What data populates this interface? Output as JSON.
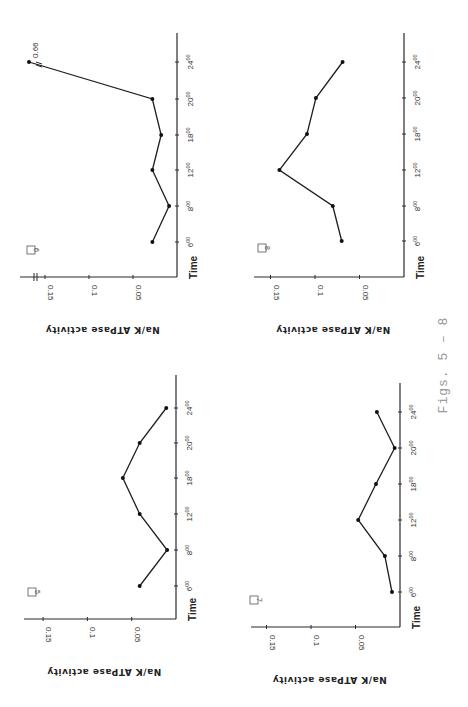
{
  "caption": "Figs. 5 – 8",
  "y_axis_title": "Na/K ATPase activity",
  "time_axis_title": "Time",
  "chart_data": [
    {
      "panel": "6",
      "type": "line",
      "title": "6",
      "xlabel": "Time",
      "ylabel": "Na/K ATPase activity",
      "categories": [
        "6:00",
        "8:00",
        "12:00",
        "18:00",
        "20:00",
        "24:00"
      ],
      "values": [
        0.028,
        0.009,
        0.028,
        0.018,
        0.028,
        0.66
      ],
      "annotations": [
        {
          "at": "24:00",
          "text": "0.66",
          "note": "axis break"
        }
      ],
      "ylim": [
        0,
        0.15
      ],
      "yticks": [
        "0.05",
        "0.1",
        "0.15"
      ],
      "orientation": "rotated 90° (value axis horizontal, time vertical)"
    },
    {
      "panel": "8",
      "type": "line",
      "title": "8",
      "xlabel": "Time",
      "ylabel": "Na/K ATPase activity",
      "categories": [
        "6:00",
        "8:00",
        "12:00",
        "18:00",
        "20:00",
        "24:00"
      ],
      "values": [
        0.07,
        0.08,
        0.14,
        0.109,
        0.099,
        0.069
      ],
      "ylim": [
        0,
        0.15
      ],
      "yticks": [
        "0.05",
        "0.1",
        "0.15"
      ]
    },
    {
      "panel": "5",
      "type": "line",
      "title": "5",
      "xlabel": "Time",
      "ylabel": "Na/K ATPase activity",
      "categories": [
        "6:00",
        "8:00",
        "12:00",
        "18:00",
        "20:00",
        "24:00"
      ],
      "values": [
        0.041,
        0.01,
        0.041,
        0.06,
        0.041,
        0.011
      ],
      "ylim": [
        0,
        0.15
      ],
      "yticks": [
        "0.05",
        "0.1",
        "0.15"
      ]
    },
    {
      "panel": "7",
      "type": "line",
      "title": "7",
      "xlabel": "Time",
      "ylabel": "Na/K ATPase activity",
      "categories": [
        "6:00",
        "8:00",
        "12:00",
        "18:00",
        "20:00",
        "24:00"
      ],
      "values": [
        0.009,
        0.017,
        0.047,
        0.027,
        0.006,
        0.026
      ],
      "ylim": [
        0,
        0.15
      ],
      "yticks": [
        "0.05",
        "0.1",
        "0.15"
      ]
    }
  ],
  "time_tick_labels": [
    {
      "h": "6",
      "sup": "00"
    },
    {
      "h": "8",
      "sup": "00"
    },
    {
      "h": "12",
      "sup": "00"
    },
    {
      "h": "18",
      "sup": "00"
    },
    {
      "h": "20",
      "sup": "00"
    },
    {
      "h": "24",
      "sup": "00"
    }
  ]
}
